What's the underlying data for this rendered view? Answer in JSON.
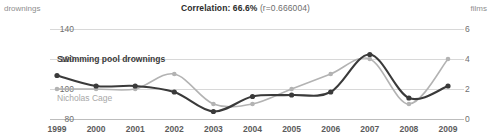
{
  "header": {
    "title_strong": "Correlation: 66.6%",
    "title_weak": "(r=0.666004)"
  },
  "axes": {
    "left_caption": "drownings",
    "right_caption": "films",
    "left_ticks": [
      "140",
      "120",
      "100",
      "80"
    ],
    "right_ticks": [
      "6",
      "4",
      "2",
      "0"
    ],
    "x_ticks": [
      "1999",
      "2000",
      "2001",
      "2002",
      "2003",
      "2004",
      "2005",
      "2006",
      "2007",
      "2008",
      "2009"
    ]
  },
  "legend": {
    "drownings_label": "Swimming pool drownings",
    "cage_label": "Nicholas Cage"
  },
  "colors": {
    "drownings": "#3a3a3a",
    "cage": "#b3b3b3",
    "grid": "#d8d8d8",
    "tick_text": "#6f6f6f"
  },
  "chart_data": {
    "type": "line",
    "title": "Correlation: 66.6% (r=0.666004)",
    "xlabel": "",
    "ylabel": "drownings",
    "y2label": "films",
    "x": [
      "1999",
      "2000",
      "2001",
      "2002",
      "2003",
      "2004",
      "2005",
      "2006",
      "2007",
      "2008",
      "2009"
    ],
    "ylim": [
      80,
      140
    ],
    "y2lim": [
      0,
      6
    ],
    "grid": true,
    "legend": "inline",
    "series": [
      {
        "name": "Swimming pool drownings",
        "axis": "left",
        "units": "drownings",
        "values": [
          109,
          102,
          102,
          98,
          85,
          95,
          96,
          98,
          123,
          94,
          102
        ]
      },
      {
        "name": "Nicholas Cage",
        "axis": "right",
        "units": "films",
        "values": [
          2,
          2,
          2,
          3,
          1,
          1,
          2,
          3,
          4,
          1,
          4
        ]
      }
    ]
  }
}
